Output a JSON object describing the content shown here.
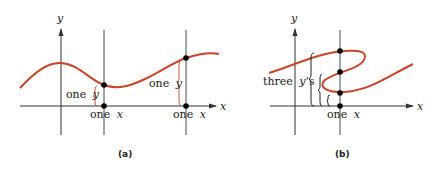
{
  "colors": {
    "curve": "#c8442a",
    "axis": "#333333",
    "brace_a": "#c8442a",
    "brace_b": "#222222",
    "point": "#000000"
  },
  "panel_a": {
    "caption": "(a)",
    "y_axis_label": "y",
    "x_axis_label": "x",
    "labels": {
      "one_y_left": "one",
      "one_y_left_var": "y",
      "one_y_right": "one",
      "one_y_right_var": "y",
      "one_x_left": "one",
      "one_x_left_var": "x",
      "one_x_right": "one",
      "one_x_right_var": "x"
    }
  },
  "panel_b": {
    "caption": "(b)",
    "y_axis_label": "y",
    "x_axis_label": "x",
    "labels": {
      "three_ys": "three",
      "three_ys_var": "y",
      "three_ys_suffix": "’s",
      "one_x": "one",
      "one_x_var": "x"
    }
  }
}
